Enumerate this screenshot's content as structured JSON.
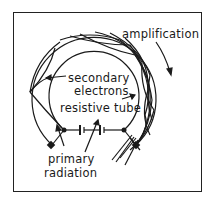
{
  "diagram": {
    "labels": {
      "amplification": "amplification",
      "secondary_line1": "secondary",
      "secondary_line2": "electrons",
      "resistive_tube": "resistive  tube",
      "primary_line1": "primary",
      "primary_line2": "radiation"
    },
    "colors": {
      "ink": "#1a1a1a",
      "background": "#ffffff"
    }
  }
}
